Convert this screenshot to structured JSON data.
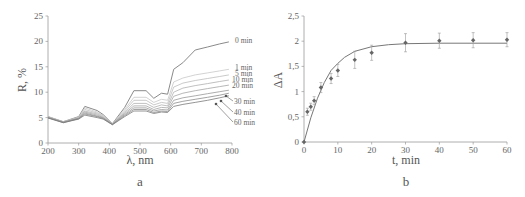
{
  "figure": {
    "panel_a_label": "a",
    "panel_b_label": "b"
  },
  "chart_data": [
    {
      "type": "line",
      "panel": "a",
      "title": "",
      "xlabel": "λ, nm",
      "ylabel": "R, %",
      "xlim": [
        200,
        800
      ],
      "ylim": [
        0,
        25
      ],
      "xticks": [
        "200",
        "300",
        "400",
        "500",
        "600",
        "700",
        "800"
      ],
      "yticks": [
        "0",
        "5",
        "10",
        "15",
        "20",
        "25"
      ],
      "grid": false,
      "legend_position": "inline-right",
      "x": [
        200,
        250,
        300,
        320,
        360,
        380,
        410,
        450,
        480,
        520,
        545,
        570,
        590,
        610,
        640,
        680,
        720,
        760,
        790
      ],
      "series": [
        {
          "name": "0 min",
          "values": [
            5.2,
            4.2,
            5.2,
            7.2,
            6.4,
            5.6,
            3.8,
            7.0,
            10.3,
            10.3,
            8.8,
            9.8,
            9.6,
            14.5,
            15.8,
            18.3,
            18.9,
            19.5,
            19.9
          ]
        },
        {
          "name": "1 min",
          "values": [
            5.2,
            4.2,
            5.1,
            6.9,
            6.1,
            5.4,
            3.8,
            6.6,
            9.0,
            9.0,
            8.0,
            8.6,
            8.4,
            12.0,
            12.8,
            13.4,
            13.8,
            14.2,
            14.5
          ]
        },
        {
          "name": "5 min",
          "values": [
            5.1,
            4.2,
            5.0,
            6.6,
            5.9,
            5.3,
            3.8,
            6.3,
            8.4,
            8.4,
            7.5,
            8.0,
            7.8,
            11.0,
            11.8,
            12.3,
            12.7,
            13.1,
            13.4
          ]
        },
        {
          "name": "10 min",
          "values": [
            5.1,
            4.1,
            4.9,
            6.3,
            5.7,
            5.1,
            3.7,
            6.0,
            7.8,
            7.8,
            7.0,
            7.5,
            7.3,
            10.0,
            10.8,
            11.3,
            11.7,
            12.1,
            12.4
          ]
        },
        {
          "name": "20 min",
          "values": [
            5.0,
            4.1,
            4.9,
            6.1,
            5.5,
            5.0,
            3.7,
            5.8,
            7.3,
            7.3,
            6.6,
            7.0,
            6.9,
            9.2,
            9.8,
            10.3,
            10.7,
            11.1,
            11.4
          ]
        },
        {
          "name": "30 min",
          "values": [
            5.0,
            4.1,
            4.8,
            5.9,
            5.3,
            4.9,
            3.7,
            5.6,
            6.9,
            6.9,
            6.3,
            6.6,
            6.5,
            8.4,
            8.9,
            9.3,
            9.7,
            10.1,
            10.4
          ]
        },
        {
          "name": "40 min",
          "values": [
            5.0,
            4.0,
            4.8,
            5.7,
            5.2,
            4.8,
            3.6,
            5.4,
            6.6,
            6.6,
            6.0,
            6.3,
            6.2,
            7.8,
            8.2,
            8.6,
            9.0,
            9.4,
            9.8
          ]
        },
        {
          "name": "60 min",
          "values": [
            4.9,
            4.0,
            4.7,
            5.5,
            5.0,
            4.7,
            3.6,
            5.2,
            6.3,
            6.3,
            5.8,
            6.1,
            6.0,
            7.2,
            7.6,
            8.0,
            8.4,
            8.9,
            9.3
          ]
        }
      ],
      "annotations": [
        "0 min",
        "1 min",
        "5 min",
        "10 min",
        "20 min",
        "30 min",
        "40 min",
        "60 min"
      ]
    },
    {
      "type": "scatter",
      "panel": "b",
      "title": "",
      "xlabel": "t, min",
      "ylabel": "ΔA",
      "xlim": [
        0,
        60
      ],
      "ylim": [
        0,
        2.5
      ],
      "xticks": [
        "0",
        "10",
        "20",
        "30",
        "40",
        "50",
        "60"
      ],
      "yticks": [
        "0",
        "0,5",
        "1",
        "1,5",
        "2",
        "2,5"
      ],
      "grid": false,
      "series": [
        {
          "name": "experimental",
          "x": [
            0,
            1,
            2,
            3,
            5,
            8,
            10,
            15,
            20,
            30,
            40,
            50,
            60
          ],
          "values": [
            0,
            0.6,
            0.7,
            0.82,
            1.08,
            1.26,
            1.42,
            1.63,
            1.77,
            1.97,
            2.01,
            2.02,
            2.03
          ],
          "error": [
            0,
            0.07,
            0.07,
            0.08,
            0.1,
            0.1,
            0.12,
            0.17,
            0.15,
            0.18,
            0.15,
            0.15,
            0.14
          ]
        },
        {
          "name": "fit",
          "type": "line",
          "x": [
            0,
            2,
            4,
            6,
            8,
            10,
            12,
            15,
            20,
            25,
            30,
            40,
            50,
            60
          ],
          "values": [
            0,
            0.48,
            0.87,
            1.18,
            1.42,
            1.56,
            1.68,
            1.8,
            1.89,
            1.93,
            1.95,
            1.96,
            1.96,
            1.96
          ]
        }
      ]
    }
  ]
}
